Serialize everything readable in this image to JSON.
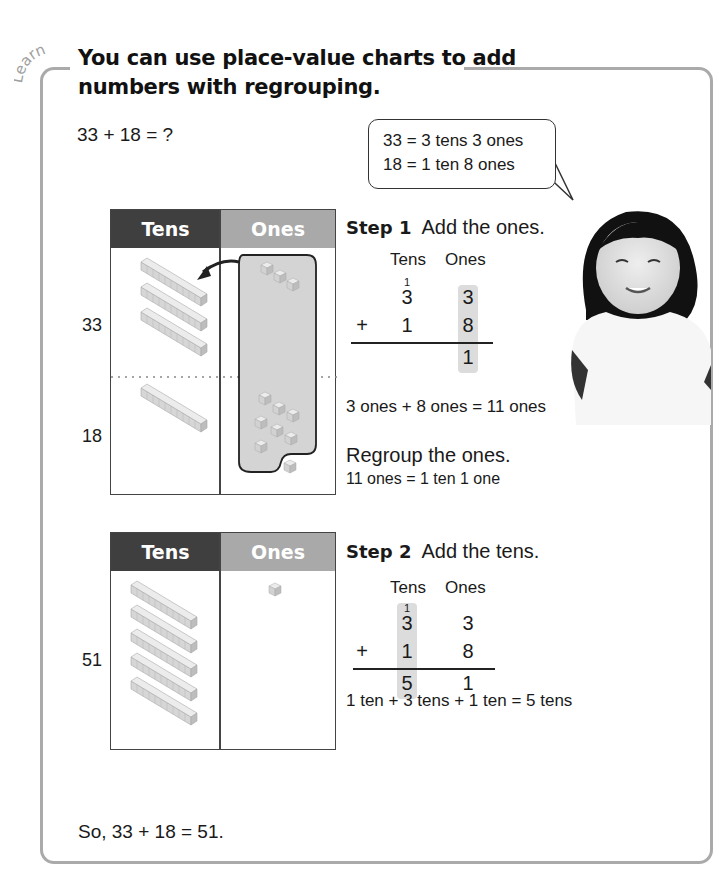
{
  "section_label": "Learn",
  "title": {
    "line1": "You can use place-value charts to add",
    "line2": "numbers with regrouping."
  },
  "problem": "33 + 18 = ?",
  "speech_bubble": {
    "line1": "33 = 3 tens 3 ones",
    "line2": "18 = 1 ten 8 ones"
  },
  "chart1": {
    "headers": [
      "Tens",
      "Ones"
    ],
    "rows": [
      {
        "label": "33",
        "tens": 3,
        "ones": 3
      },
      {
        "label": "18",
        "tens": 1,
        "ones": 8
      }
    ],
    "regroup_note": "10 ones circled and moved to tens"
  },
  "step1": {
    "label": "Step 1",
    "instruction": "Add the ones.",
    "col_headers": [
      "Tens",
      "Ones"
    ],
    "carry": "1",
    "addend1": [
      "3",
      "3"
    ],
    "operator": "+",
    "addend2": [
      "1",
      "8"
    ],
    "result": [
      "",
      "1"
    ],
    "explanation": "3 ones + 8 ones = 11 ones",
    "regroup_title": "Regroup the ones.",
    "regroup_detail": "11 ones = 1 ten 1 one"
  },
  "chart2": {
    "headers": [
      "Tens",
      "Ones"
    ],
    "rows": [
      {
        "label": "51",
        "tens": 5,
        "ones": 1
      }
    ]
  },
  "step2": {
    "label": "Step 2",
    "instruction": "Add the tens.",
    "col_headers": [
      "Tens",
      "Ones"
    ],
    "carry": "1",
    "addend1": [
      "3",
      "3"
    ],
    "operator": "+",
    "addend2": [
      "1",
      "8"
    ],
    "result": [
      "5",
      "1"
    ],
    "explanation": "1 ten + 3 tens + 1 ten = 5 tens"
  },
  "conclusion": "So, 33 + 18 = 51.",
  "colors": {
    "tens_header": "#3f3f3f",
    "ones_header": "#a9a9a9",
    "frame": "#aaaaaa",
    "highlight": "#dcdcdc"
  }
}
